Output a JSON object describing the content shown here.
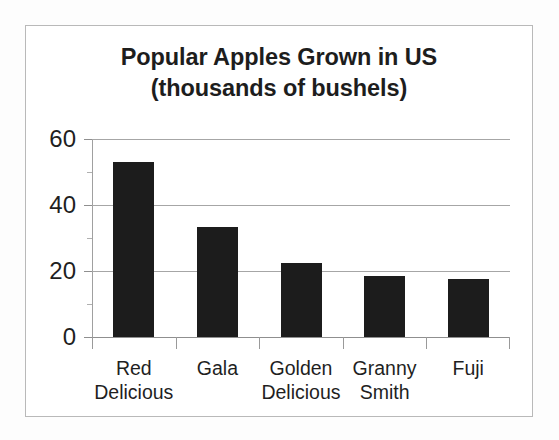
{
  "chart_data": {
    "type": "bar",
    "title": "Popular Apples Grown in US (thousands of bushels)",
    "title_lines": [
      "Popular Apples Grown in US",
      "(thousands of bushels)"
    ],
    "categories": [
      "Red Delicious",
      "Gala",
      "Golden Delicious",
      "Granny Smith",
      "Fuji"
    ],
    "category_lines": [
      [
        "Red",
        "Delicious"
      ],
      [
        "Gala"
      ],
      [
        "Golden",
        "Delicious"
      ],
      [
        "Granny",
        "Smith"
      ],
      [
        "Fuji"
      ]
    ],
    "values": [
      53,
      33.5,
      22.5,
      18.5,
      17.5
    ],
    "xlabel": "",
    "ylabel": "",
    "ylim": [
      0,
      60
    ],
    "y_ticks": [
      0,
      20,
      40,
      60
    ],
    "y_tick_labels": [
      "0",
      "20",
      "40",
      "60"
    ],
    "y_minor_ticks": [
      10,
      30,
      50
    ],
    "grid": true,
    "grid_axis": "y",
    "legend": false,
    "legend_position": "none",
    "units": "thousands of bushels",
    "series": [
      {
        "name": "Bushels",
        "values": [
          53,
          33.5,
          22.5,
          18.5,
          17.5
        ]
      }
    ],
    "bar_color": "#1c1c1c",
    "gridline_color": "#a6a6a6",
    "axis_color": "#8f8f8f",
    "text_color": "#1f1f1f",
    "background_color": "#ffffff",
    "frame_border_color": "#b9b9b9"
  }
}
